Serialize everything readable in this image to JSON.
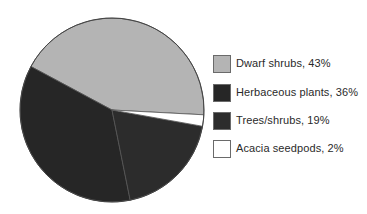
{
  "chart_data": {
    "type": "pie",
    "title": "",
    "categories": [
      "Dwarf shrubs",
      "Herbaceous plants",
      "Trees/shrubs",
      "Acacia seedpods"
    ],
    "values": [
      43,
      36,
      19,
      2
    ],
    "colors": [
      "#b4b4b4",
      "#262626",
      "#2c2c2c",
      "#ffffff"
    ],
    "legend_position": "right",
    "legend_labels": [
      "Dwarf shrubs, 43%",
      "Herbaceous plants, 36%",
      "Trees/shrubs, 19%",
      "Acacia seedpods, 2%"
    ],
    "start_angle_deg": -3,
    "direction": "counterclockwise",
    "grid": false
  },
  "legend": {
    "items": [
      {
        "label": "Dwarf shrubs, 43%",
        "color": "#b4b4b4"
      },
      {
        "label": "Herbaceous plants, 36%",
        "color": "#262626"
      },
      {
        "label": "Trees/shrubs, 19%",
        "color": "#2c2c2c"
      },
      {
        "label": "Acacia seedpods, 2%",
        "color": "#ffffff"
      }
    ]
  }
}
